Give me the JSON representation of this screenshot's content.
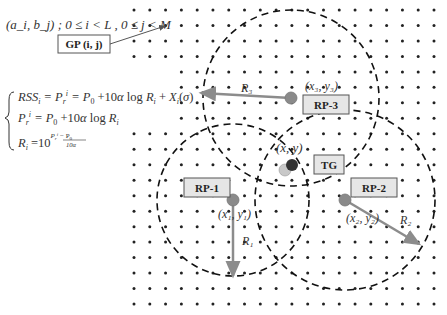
{
  "header": {
    "coord_def": "(a_i, b_j) ;  0 ≤ i < L ,  0 ≤ j < M",
    "grid_point_label": "GP (i, j)"
  },
  "formulas": {
    "line1": "RSS_i = P_r^i = P_0 + 10α log R_i + X_i(σ)",
    "line2": "P_r^i = P_0 + 10α log R_i",
    "line3": "R_i = 10^((P_r^i − P_0)/(10α))"
  },
  "grid": {
    "cols": 20,
    "rows": 20,
    "x0": 134,
    "x1": 434,
    "y0": 10,
    "y1": 304,
    "occluded_rows": [
      4,
      5,
      6,
      7
    ],
    "occluded_first_col": 3
  },
  "reference_points": [
    {
      "id": "rp1",
      "label": "RP-1",
      "coord": "(x₁, y₁)",
      "radius_label": "R₁",
      "cx": 233,
      "cy": 200,
      "r": 76,
      "box": [
        184,
        178,
        46,
        19
      ],
      "coord_pos": [
        218,
        218
      ],
      "arrow_to": [
        233,
        276
      ],
      "rlabel_pos": [
        242,
        245
      ]
    },
    {
      "id": "rp2",
      "label": "RP-2",
      "coord": "(x₂, y₂)",
      "radius_label": "R₂",
      "cx": 345,
      "cy": 200,
      "r": 90,
      "box": [
        351,
        178,
        46,
        19
      ],
      "coord_pos": [
        346,
        222
      ],
      "arrow_to": [
        419,
        244
      ],
      "rlabel_pos": [
        400,
        224
      ]
    },
    {
      "id": "rp3",
      "label": "RP-3",
      "coord": "(x₃, y₃)",
      "radius_label": "R₃",
      "cx": 291,
      "cy": 98,
      "r": 88,
      "box": [
        303,
        95,
        46,
        19
      ],
      "coord_pos": [
        305,
        90
      ],
      "arrow_to": [
        201,
        93
      ],
      "rlabel_pos": [
        241,
        92
      ]
    }
  ],
  "target": {
    "label": "TG",
    "coord": "(x, y)",
    "estimate_color": "#c8c8c8",
    "true_color": "#333333",
    "box": [
      314,
      155,
      30,
      19
    ]
  },
  "colors": {
    "rp_fill": "#8a8a8a",
    "arrow": "#8c8c8c",
    "dash": "#111111",
    "dot": "#222222"
  }
}
